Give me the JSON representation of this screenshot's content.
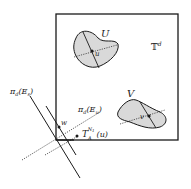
{
  "diagram": {
    "torus_label": "𝕋",
    "torus_sup": "d",
    "regions": [
      {
        "name": "U",
        "point": "u"
      },
      {
        "name": "V",
        "point": "v"
      }
    ],
    "stable_proj": {
      "pi": "π",
      "sub": "d",
      "open": "(",
      "E": "E",
      "Esub": "s",
      "close": ")"
    },
    "unstable_proj": {
      "pi": "π",
      "sub": "d",
      "open": "(",
      "E": "E",
      "Esub": "u",
      "close": ")"
    },
    "point_w": "w",
    "translate": {
      "T": "T",
      "sub": "A",
      "sup": "N",
      "supsub": "1",
      "arg": "(u)"
    },
    "colors": {
      "fill": "#d9d9d9",
      "stroke": "#1a1a1a"
    }
  }
}
